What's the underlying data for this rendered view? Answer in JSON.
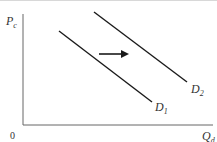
{
  "diagram": {
    "y_axis": {
      "label": "P",
      "subscript": "c"
    },
    "x_axis": {
      "label": "Q",
      "subscript": "d"
    },
    "origin": "0",
    "curves": [
      {
        "label": "D",
        "subscript": "1",
        "from": [
          59,
          31
        ],
        "to": [
          152,
          102
        ]
      },
      {
        "label": "D",
        "subscript": "2",
        "from": [
          94,
          12
        ],
        "to": [
          187,
          82
        ]
      }
    ],
    "arrow": {
      "direction": "right",
      "meaning": "shift from D1 to D2"
    },
    "colors": {
      "line": "#1a1a1a",
      "axis": "#555555"
    }
  }
}
